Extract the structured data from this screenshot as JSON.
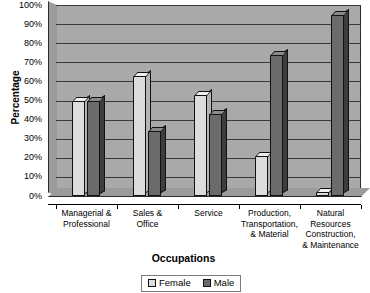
{
  "chart_data": {
    "type": "bar",
    "title": "",
    "xlabel": "Occupations",
    "ylabel": "Percentage",
    "ylim": [
      0,
      100
    ],
    "ytick_labels": [
      "100%",
      "90%",
      "80%",
      "70%",
      "60%",
      "50%",
      "40%",
      "30%",
      "20%",
      "10%",
      "0%"
    ],
    "ytick_values": [
      100,
      90,
      80,
      70,
      60,
      50,
      40,
      30,
      20,
      10,
      0
    ],
    "grid": true,
    "legend_position": "bottom-center",
    "categories": [
      "Managerial &\nProfessional",
      "Sales &\nOffice",
      "Service",
      "Production,\nTransportation,\n& Material",
      "Natural\nResources\nConstruction,\n& Maintenance"
    ],
    "series": [
      {
        "name": "Female",
        "color": "#dcdcdc",
        "values": [
          50,
          63,
          53,
          21,
          2
        ]
      },
      {
        "name": "Male",
        "color": "#6b6b6b",
        "values": [
          50,
          34,
          43,
          74,
          95
        ]
      }
    ]
  },
  "legend": {
    "items": [
      {
        "label": "Female",
        "swatch": "female"
      },
      {
        "label": "Male",
        "swatch": "male"
      }
    ]
  }
}
